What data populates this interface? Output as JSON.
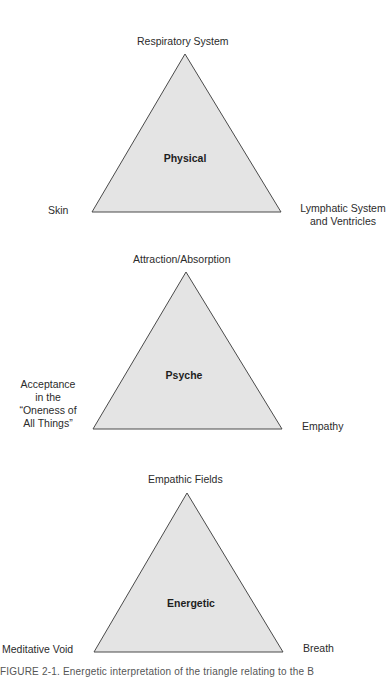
{
  "colors": {
    "triangle_fill": "#e4e4e4",
    "triangle_stroke": "#4a4a4a",
    "text": "#2b2b2b"
  },
  "triangles": [
    {
      "title": "Physical",
      "apex_label": "Respiratory System",
      "left_label": "Skin",
      "right_label_line1": "Lymphatic System",
      "right_label_line2": "and Ventricles"
    },
    {
      "title": "Psyche",
      "apex_label": "Attraction/Absorption",
      "left_label_line1": "Acceptance",
      "left_label_line2": "in the",
      "left_label_line3": "“Oneness of",
      "left_label_line4": "All Things”",
      "right_label": "Empathy"
    },
    {
      "title": "Energetic",
      "apex_label": "Empathic Fields",
      "left_label": "Meditative Void",
      "right_label": "Breath"
    }
  ],
  "caption": "FIGURE 2-1. Energetic interpretation of the triangle relating to the B"
}
